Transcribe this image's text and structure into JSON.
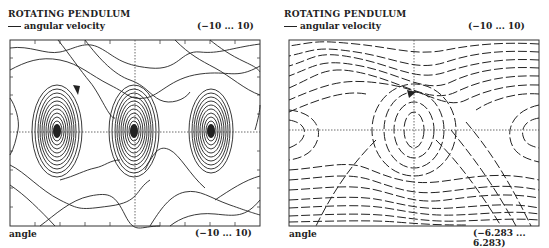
{
  "left": {
    "title": "ROTATING PENDULUM",
    "legend": "angular velocity",
    "y_range": "(−10 ... 10)",
    "x_label": "angle",
    "x_range": "(−10 ... 10)",
    "plot_style": "phase-portrait-solid-trajectories"
  },
  "right": {
    "title": "ROTATING PENDULUM",
    "legend": "angular velocity",
    "y_range": "(−10 ... 10)",
    "x_label": "angle",
    "x_range": "(−6.283 ... 6.283)",
    "plot_style": "direction-field-dashed"
  },
  "colors": {
    "ink": "#222222",
    "background": "#ffffff"
  }
}
